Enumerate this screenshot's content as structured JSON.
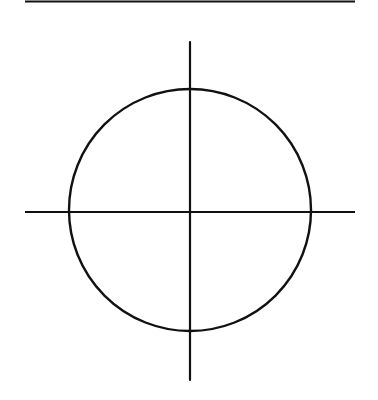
{
  "diagram": {
    "stroke_color": "#111111",
    "background_color": "#ffffff",
    "top_rule": {
      "x1": 25,
      "y1": 1.5,
      "x2": 355,
      "y2": 1.5,
      "width": 2
    },
    "vertical_axis": {
      "x1": 190,
      "y1": 42,
      "x2": 190,
      "y2": 380,
      "width": 2.2
    },
    "horizontal_axis": {
      "x1": 25,
      "y1": 212,
      "x2": 355,
      "y2": 212,
      "width": 2.2
    },
    "circle": {
      "cx": 190,
      "cy": 210,
      "r": 121,
      "width": 2.4
    }
  }
}
